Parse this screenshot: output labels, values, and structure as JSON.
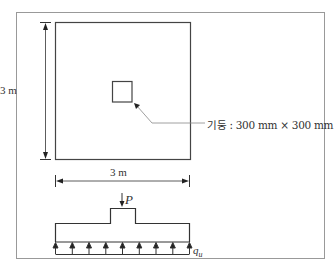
{
  "figure": {
    "plan": {
      "width_label": "3 m",
      "height_label": "3 m",
      "column_label": "기둥 : 300 mm × 300 mm"
    },
    "section": {
      "load_label": "P",
      "pressure_label": "q",
      "pressure_subscript": "u",
      "arrow_count": 9
    }
  },
  "colors": {
    "line": "#333333",
    "frame": "#999999",
    "leader": "#888888"
  }
}
